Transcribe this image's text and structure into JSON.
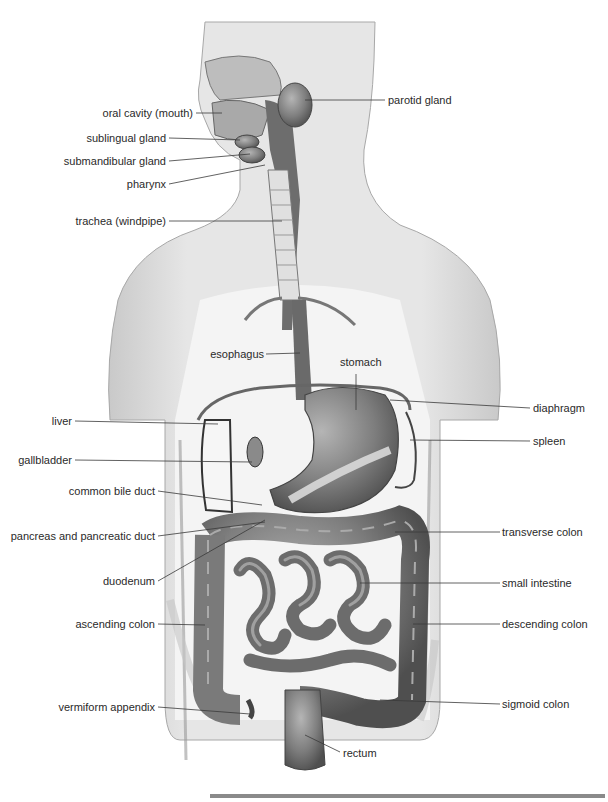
{
  "diagram": {
    "labels_left": [
      {
        "id": "oral-cavity",
        "text": "oral cavity (mouth)",
        "x": 193,
        "y": 113
      },
      {
        "id": "sublingual-gland",
        "text": "sublingual gland",
        "x": 166,
        "y": 138
      },
      {
        "id": "submandibular-gland",
        "text": "submandibular gland",
        "x": 166,
        "y": 161
      },
      {
        "id": "pharynx",
        "text": "pharynx",
        "x": 166,
        "y": 184
      },
      {
        "id": "trachea",
        "text": "trachea (windpipe)",
        "x": 166,
        "y": 221
      },
      {
        "id": "esophagus",
        "text": "esophagus",
        "x": 264,
        "y": 355
      },
      {
        "id": "liver",
        "text": "liver",
        "x": 72,
        "y": 421
      },
      {
        "id": "gallbladder",
        "text": "gallbladder",
        "x": 72,
        "y": 460
      },
      {
        "id": "common-bile-duct",
        "text": "common bile duct",
        "x": 155,
        "y": 491
      },
      {
        "id": "pancreas",
        "text": "pancreas and pancreatic duct",
        "x": 155,
        "y": 536
      },
      {
        "id": "duodenum",
        "text": "duodenum",
        "x": 155,
        "y": 581
      },
      {
        "id": "ascending-colon",
        "text": "ascending colon",
        "x": 155,
        "y": 624
      },
      {
        "id": "vermiform-appendix",
        "text": "vermiform appendix",
        "x": 155,
        "y": 707
      }
    ],
    "labels_right": [
      {
        "id": "parotid-gland",
        "text": "parotid gland",
        "x": 388,
        "y": 100
      },
      {
        "id": "stomach",
        "text": "stomach",
        "x": 340,
        "y": 362
      },
      {
        "id": "diaphragm",
        "text": "diaphragm",
        "x": 533,
        "y": 408
      },
      {
        "id": "spleen",
        "text": "spleen",
        "x": 533,
        "y": 441
      },
      {
        "id": "transverse-colon",
        "text": "transverse colon",
        "x": 502,
        "y": 532
      },
      {
        "id": "small-intestine",
        "text": "small intestine",
        "x": 502,
        "y": 583
      },
      {
        "id": "descending-colon",
        "text": "descending colon",
        "x": 502,
        "y": 624
      },
      {
        "id": "sigmoid-colon",
        "text": "sigmoid colon",
        "x": 502,
        "y": 704
      },
      {
        "id": "rectum",
        "text": "rectum",
        "x": 343,
        "y": 753
      }
    ],
    "colors": {
      "body_fill": "#e3e3e3",
      "body_edge": "#9a9a9a",
      "organ_dark": "#6e6e6e",
      "organ_mid": "#8c8c8c",
      "organ_light": "#b8b8b8",
      "leader_line": "#3a3a3a",
      "label_text": "#2a2a2a",
      "footer_bar": "#8a8a8a"
    }
  }
}
